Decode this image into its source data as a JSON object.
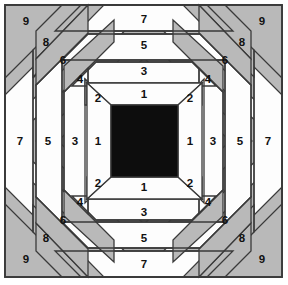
{
  "figure": {
    "kind": "pineapple-log-cabin-quilt-block-diagram",
    "title": "",
    "canvas": {
      "width": 288,
      "height": 285
    },
    "frame": {
      "x": 5,
      "y": 5,
      "width": 277,
      "height": 272,
      "stroke": "#3a3a3a",
      "stroke_width": 1.6
    }
  },
  "colors": {
    "background": "#ffffff",
    "light_fabric": "#fdfdfd",
    "dark_fabric": "#b9b9b9",
    "center_square": "#0d0d0d",
    "outline": "#3a3a3a",
    "label_text": "#111111"
  },
  "geometry": {
    "center": {
      "cx": 144.0,
      "cy": 141.0
    },
    "center_square": {
      "x": 111,
      "y": 105,
      "width": 67,
      "height": 72
    },
    "ring_offsets_straight": [
      33.5,
      52.0,
      70.5,
      89.0,
      107.5,
      126.0,
      138.5
    ],
    "ring_offsets_diagonal": [
      26.0,
      48.0,
      70.0,
      92.0,
      114.0
    ]
  },
  "legend": {
    "light_pieces_label": "light fabric (odd numbers)",
    "dark_pieces_label": "dark fabric (even numbers)",
    "center_label": "center square"
  },
  "pieces": {
    "straight_numbers": [
      1,
      3,
      5,
      7
    ],
    "diagonal_numbers": [
      2,
      4,
      6,
      8,
      9
    ],
    "top": [
      {
        "n": "1",
        "x": 144,
        "y": 95
      },
      {
        "n": "3",
        "x": 144,
        "y": 72
      },
      {
        "n": "5",
        "x": 144,
        "y": 46
      },
      {
        "n": "7",
        "x": 144,
        "y": 20
      }
    ],
    "bottom": [
      {
        "n": "1",
        "x": 144,
        "y": 188
      },
      {
        "n": "3",
        "x": 144,
        "y": 213
      },
      {
        "n": "5",
        "x": 144,
        "y": 239
      },
      {
        "n": "7",
        "x": 144,
        "y": 265
      }
    ],
    "left": [
      {
        "n": "1",
        "x": 98,
        "y": 142
      },
      {
        "n": "3",
        "x": 72,
        "y": 142
      },
      {
        "n": "5",
        "x": 46,
        "y": 142
      },
      {
        "n": "7",
        "x": 20,
        "y": 142
      }
    ],
    "right": [
      {
        "n": "1",
        "x": 190,
        "y": 142
      },
      {
        "n": "3",
        "x": 216,
        "y": 142
      },
      {
        "n": "5",
        "x": 242,
        "y": 142
      },
      {
        "n": "7",
        "x": 268,
        "y": 142
      }
    ],
    "corner_top_left": [
      {
        "n": "2",
        "x": 98,
        "y": 99
      },
      {
        "n": "4",
        "x": 80,
        "y": 80
      },
      {
        "n": "6",
        "x": 63,
        "y": 62
      },
      {
        "n": "8",
        "x": 46,
        "y": 44
      },
      {
        "n": "9",
        "x": 26,
        "y": 23
      }
    ],
    "corner_top_right": [
      {
        "n": "2",
        "x": 190,
        "y": 99
      },
      {
        "n": "4",
        "x": 208,
        "y": 80
      },
      {
        "n": "6",
        "x": 225,
        "y": 62
      },
      {
        "n": "8",
        "x": 242,
        "y": 44
      },
      {
        "n": "9",
        "x": 262,
        "y": 23
      }
    ],
    "corner_bottom_left": [
      {
        "n": "2",
        "x": 98,
        "y": 184
      },
      {
        "n": "4",
        "x": 80,
        "y": 203
      },
      {
        "n": "6",
        "x": 63,
        "y": 221
      },
      {
        "n": "8",
        "x": 46,
        "y": 239
      },
      {
        "n": "9",
        "x": 26,
        "y": 260
      }
    ],
    "corner_bottom_right": [
      {
        "n": "2",
        "x": 190,
        "y": 184
      },
      {
        "n": "4",
        "x": 208,
        "y": 203
      },
      {
        "n": "6",
        "x": 225,
        "y": 221
      },
      {
        "n": "8",
        "x": 242,
        "y": 239
      },
      {
        "n": "9",
        "x": 262,
        "y": 260
      }
    ]
  }
}
